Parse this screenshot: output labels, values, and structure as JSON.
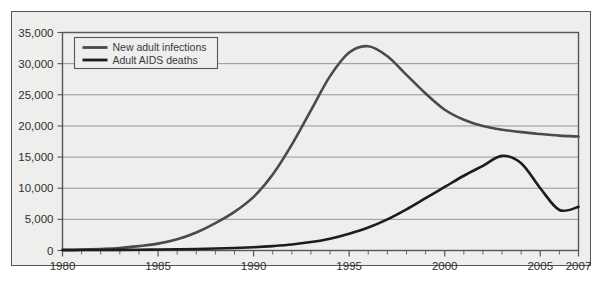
{
  "chart_data": {
    "type": "line",
    "title": "",
    "xlabel": "",
    "ylabel": "",
    "xlim": [
      1980,
      2007
    ],
    "ylim": [
      0,
      35000
    ],
    "grid": true,
    "legend_position": "top-left",
    "y_ticks": [
      0,
      5000,
      10000,
      15000,
      20000,
      25000,
      30000,
      35000
    ],
    "y_tick_labels": [
      "0",
      "5,000",
      "10,000",
      "15,000",
      "20,000",
      "25,000",
      "30,000",
      "35,000"
    ],
    "x_ticks": [
      1980,
      1985,
      1990,
      1995,
      2000,
      2005,
      2007
    ],
    "x_tick_labels": [
      "1980",
      "1985",
      "1990",
      "1995",
      "2000",
      "2005",
      "2007"
    ],
    "x_minor_ticks": [
      1981,
      1982,
      1983,
      1984,
      1986,
      1987,
      1988,
      1989,
      1991,
      1992,
      1993,
      1994,
      1996,
      1997,
      1998,
      1999,
      2001,
      2002,
      2003,
      2004,
      2006
    ],
    "x": [
      1980,
      1981,
      1982,
      1983,
      1984,
      1985,
      1986,
      1987,
      1988,
      1989,
      1990,
      1991,
      1992,
      1993,
      1994,
      1995,
      1996,
      1997,
      1998,
      1999,
      2000,
      2001,
      2002,
      2003,
      2004,
      2005,
      2006,
      2007
    ],
    "series": [
      {
        "name": "New adult infections",
        "color": "#4a4a4c",
        "values": [
          100,
          150,
          250,
          400,
          700,
          1100,
          1800,
          2900,
          4400,
          6200,
          8600,
          12200,
          17000,
          22500,
          28000,
          31800,
          32800,
          31200,
          28200,
          25200,
          22600,
          21000,
          20000,
          19400,
          19000,
          18700,
          18450,
          18300
        ]
      },
      {
        "name": "Adult AIDS deaths",
        "color": "#1c1c1e",
        "values": [
          60,
          70,
          80,
          100,
          120,
          150,
          190,
          240,
          310,
          400,
          520,
          700,
          950,
          1350,
          1900,
          2700,
          3700,
          5000,
          6600,
          8400,
          10200,
          12000,
          13600,
          15200,
          14000,
          10000,
          6500,
          7000
        ]
      }
    ]
  },
  "legend": {
    "items": [
      {
        "label": "New adult infections",
        "color": "#4a4a4c"
      },
      {
        "label": "Adult AIDS deaths",
        "color": "#1c1c1e"
      }
    ]
  },
  "style": {
    "plot_background": "#eeeeec",
    "grid_color": "#8c8c8e",
    "axis_color": "#55565a",
    "frame_color": "#55565a",
    "text_color": "#2e2e30"
  }
}
